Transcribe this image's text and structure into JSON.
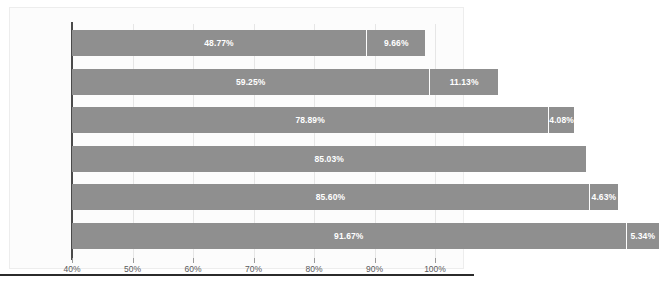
{
  "chart_data": {
    "type": "bar",
    "orientation": "horizontal",
    "stacked": true,
    "title": "",
    "xlabel": "",
    "ylabel": "",
    "xlim": [
      40,
      100
    ],
    "xticks": [
      40,
      50,
      60,
      70,
      80,
      90,
      100
    ],
    "xtick_labels": [
      "40%",
      "50%",
      "60%",
      "70%",
      "80%",
      "90%",
      "100%"
    ],
    "grid": true,
    "legend": "none",
    "categories": [
      "LINE 1",
      "LINE 3",
      "LINE 4",
      "LINE 2",
      "PACKING",
      "COCOA"
    ],
    "series": [
      {
        "name": "segment-1",
        "values": [
          48.77,
          59.25,
          78.89,
          85.03,
          85.6,
          91.67
        ],
        "labels": [
          "48.77%",
          "59.25%",
          "78.89%",
          "85.03%",
          "85.60%",
          "91.67%"
        ]
      },
      {
        "name": "segment-2",
        "values": [
          9.66,
          11.13,
          4.08,
          0,
          4.63,
          5.34
        ],
        "labels": [
          "9.66%",
          "11.13%",
          "4.08%",
          "",
          "4.63%",
          "5.34%"
        ]
      }
    ],
    "totals": [
      58.43,
      70.38,
      82.97,
      85.03,
      90.23,
      97.01
    ],
    "colors": {
      "bar": "#8f8f8f",
      "bar_divider": "#fdfdfd",
      "value_label": "#ffffff",
      "axis_line": "#4a4a4a",
      "gridline": "#e6e6e6",
      "tick_label": "#59595b",
      "category_label": "#59595b",
      "plot_background": "#fcfcfc",
      "frame_border": "#ededed",
      "bottom_rule": "#2b2b2b"
    }
  }
}
